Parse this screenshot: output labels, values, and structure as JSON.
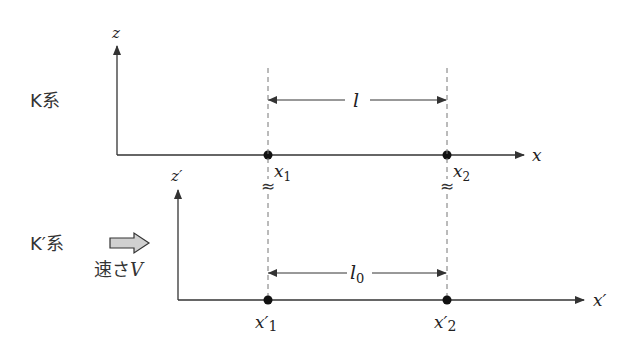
{
  "frames": {
    "K": {
      "label": "K系",
      "axis_vertical": "z",
      "axis_horizontal": "x",
      "points": [
        {
          "name": "x",
          "sub": "1"
        },
        {
          "name": "x",
          "sub": "2"
        }
      ],
      "length": {
        "symbol": "l",
        "sub": ""
      }
    },
    "K_prime": {
      "label": "K′系",
      "axis_vertical": "z′",
      "axis_horizontal": "x′",
      "points": [
        {
          "name": "x′",
          "sub": "1"
        },
        {
          "name": "x′",
          "sub": "2"
        }
      ],
      "length": {
        "symbol": "l",
        "sub": "0"
      }
    }
  },
  "velocity": {
    "label_prefix": "速さ",
    "symbol": "V",
    "icon": "right-arrow-icon"
  },
  "break_mark": "≈",
  "colors": {
    "line": "#333333",
    "dashed": "#666666",
    "arrow_fill": "#cccccc",
    "background": "#ffffff"
  }
}
